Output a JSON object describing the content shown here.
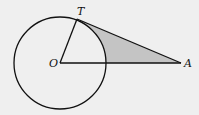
{
  "diagram": {
    "type": "geometry",
    "colors": {
      "background": "#efefef",
      "stroke": "#111111",
      "shade": "#c4c4c4"
    },
    "points": {
      "O": {
        "label": "O",
        "x": 60,
        "y": 63
      },
      "T": {
        "label": "T",
        "x": 77,
        "y": 19
      },
      "A": {
        "label": "A",
        "x": 181,
        "y": 63
      }
    },
    "circle": {
      "center": "O",
      "radius": 46
    },
    "segments": [
      "OT",
      "TA",
      "OA"
    ]
  }
}
